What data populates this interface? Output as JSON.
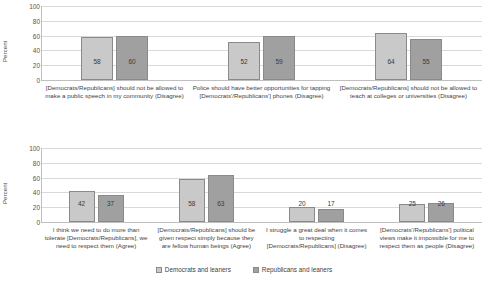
{
  "legend": {
    "position": "bottom-center",
    "entries": [
      {
        "label": "Democrats and leaners",
        "color": "#c9c9c9"
      },
      {
        "label": "Republicans and leaners",
        "color": "#a0a0a0"
      }
    ]
  },
  "axis": {
    "ylabel": "Percent",
    "ticks": [
      "100",
      "80",
      "60",
      "40",
      "20",
      "0"
    ]
  },
  "chart_data": [
    {
      "type": "bar",
      "title": "",
      "xlabel": "",
      "ylabel": "Percent",
      "ylim": [
        0,
        100
      ],
      "grid": true,
      "legend_position": "bottom-center",
      "categories": [
        "[Democrats/Republicans] should not be allowed to make a public speech in my community (Disagree)",
        "Police should have better opportunities for tapping [Democrats'/Republicans'] phones (Disagree)",
        "[Democrats/Republicans] should not be allowed to teach at colleges or universities (Disagree)"
      ],
      "series": [
        {
          "name": "Democrats and leaners",
          "values": [
            58,
            52,
            64
          ]
        },
        {
          "name": "Republicans and leaners",
          "values": [
            60,
            59,
            55
          ]
        }
      ]
    },
    {
      "type": "bar",
      "title": "",
      "xlabel": "",
      "ylabel": "Percent",
      "ylim": [
        0,
        100
      ],
      "grid": true,
      "legend_position": "bottom-center",
      "categories": [
        "I think we need to do more than tolerate [Democrats/Republicans], we need to respect them (Agree)",
        "[Democrats/Republicans] should be given respect simply because they are fellow human beings (Agree)",
        "I struggle a great deal when it comes to respecting [Democrats/Republicans] (Disagree)",
        "[Democrats'/Republicans'] political views make it impossible for me to respect them as people (Disagree)"
      ],
      "series": [
        {
          "name": "Democrats and leaners",
          "values": [
            42,
            58,
            20,
            25
          ]
        },
        {
          "name": "Republicans and leaners",
          "values": [
            37,
            63,
            17,
            26
          ]
        }
      ]
    }
  ]
}
